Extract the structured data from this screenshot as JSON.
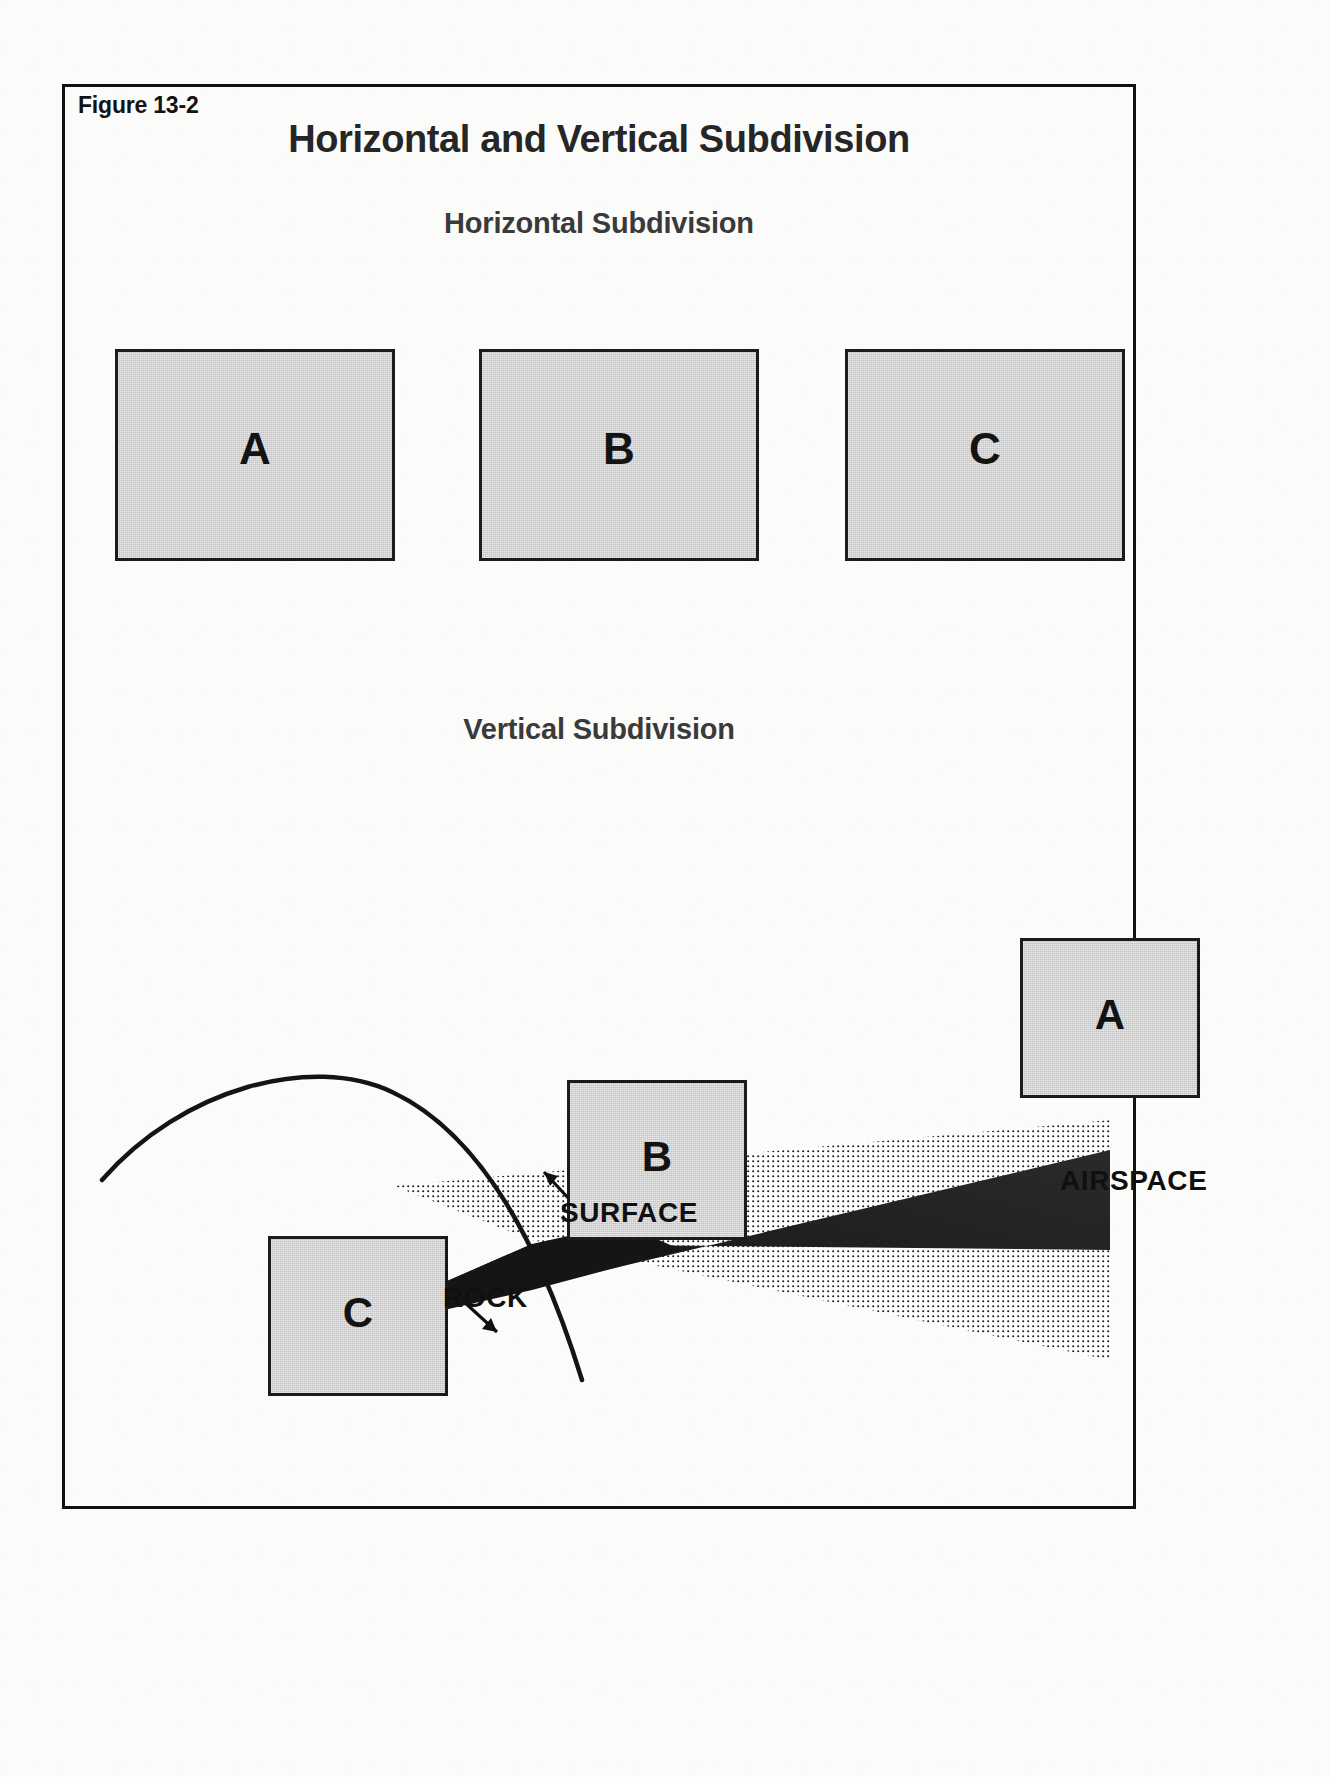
{
  "figure": {
    "number": "Figure 13-2",
    "title": "Horizontal and Vertical Subdivision"
  },
  "sections": {
    "horizontal": {
      "heading": "Horizontal Subdivision",
      "parcels": [
        {
          "label": "A"
        },
        {
          "label": "B"
        },
        {
          "label": "C"
        }
      ]
    },
    "vertical": {
      "heading": "Vertical Subdivision",
      "parcels": [
        {
          "label": "A"
        },
        {
          "label": "B"
        },
        {
          "label": "C"
        }
      ],
      "callouts": [
        {
          "id": "surface",
          "label": "SURFACE"
        },
        {
          "id": "rock",
          "label": "ROCK"
        },
        {
          "id": "airspace",
          "label": "AIRSPACE"
        }
      ]
    }
  },
  "colors": {
    "parcel_fill": "#c2c2c2",
    "parcel_border": "#1b1b1b",
    "frame": "#111111",
    "title_text": "#262626",
    "heading_text": "#3a3a3a",
    "label_text": "#101010",
    "page_background": "#fbfbfa"
  }
}
